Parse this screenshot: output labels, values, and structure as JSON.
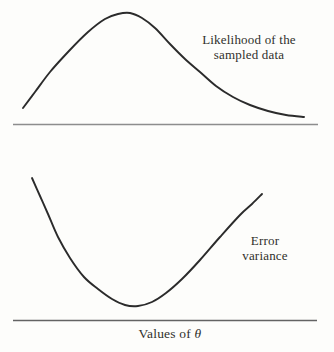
{
  "figure": {
    "top_panel": {
      "label_line1": "Likelihood of the",
      "label_line2": "sampled data"
    },
    "bottom_panel": {
      "label_line1": "Error",
      "label_line2": "variance"
    },
    "x_axis_label_text": "Values of ",
    "x_axis_label_symbol": "θ"
  },
  "colors": {
    "background": "#fdfdfb",
    "curve": "#2b2b2b",
    "axis_top": "#8d8d8d",
    "axis_bottom": "#636363",
    "text": "#30302c"
  },
  "chart_data": [
    {
      "type": "line",
      "title": "Likelihood of the sampled data",
      "xlabel": "Values of θ",
      "ylabel": "",
      "description": "Skewed bell-shaped likelihood curve: rises from near the axis, peaks at an intermediate value of theta, then falls off with a long right tail toward the axis",
      "axis": "unlabeled horizontal baseline, no tick marks or numeric scale",
      "points_px": [
        [
          23,
          108
        ],
        [
          35,
          92
        ],
        [
          50,
          72
        ],
        [
          68,
          52
        ],
        [
          88,
          32
        ],
        [
          105,
          19
        ],
        [
          118,
          14
        ],
        [
          130,
          13
        ],
        [
          142,
          18
        ],
        [
          155,
          28
        ],
        [
          170,
          44
        ],
        [
          185,
          59
        ],
        [
          200,
          72
        ],
        [
          216,
          86
        ],
        [
          233,
          97
        ],
        [
          250,
          105
        ],
        [
          268,
          111
        ],
        [
          286,
          115
        ],
        [
          304,
          117
        ]
      ],
      "baseline_px": {
        "y": 124.5,
        "x1": 13,
        "x2": 318
      }
    },
    {
      "type": "line",
      "title": "Error variance",
      "xlabel": "Values of θ",
      "ylabel": "",
      "description": "U-shaped error-variance curve: high at left, descends to a minimum at an intermediate value of theta, then rises nearly linearly to the upper right",
      "axis": "unlabeled horizontal baseline, no tick marks or numeric scale",
      "points_px": [
        [
          32,
          178
        ],
        [
          40,
          196
        ],
        [
          48,
          214
        ],
        [
          58,
          237
        ],
        [
          70,
          258
        ],
        [
          84,
          277
        ],
        [
          98,
          289
        ],
        [
          112,
          299
        ],
        [
          125,
          305
        ],
        [
          138,
          306
        ],
        [
          152,
          302
        ],
        [
          166,
          293
        ],
        [
          182,
          279
        ],
        [
          200,
          260
        ],
        [
          220,
          237
        ],
        [
          240,
          215
        ],
        [
          252,
          204
        ],
        [
          262,
          194
        ]
      ],
      "baseline_px": {
        "y": 320.5,
        "x1": 13,
        "x2": 317
      }
    }
  ]
}
